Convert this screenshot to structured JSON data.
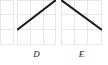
{
  "figure": {
    "background_color": "#ffffff",
    "grid_color": "#e6e6e6",
    "line_color": "#1a1a1a",
    "panel_count_visible": 3
  },
  "chart_data": [
    {
      "id": "panel-c",
      "type": "line",
      "title": "",
      "label": "",
      "truncated": true,
      "note": "partially visible panel clipped by left edge of image",
      "grid": {
        "on": true,
        "columns": 3,
        "rows": 3
      },
      "xlabel": "",
      "ylabel": "",
      "xlim": [
        0,
        3
      ],
      "ylim": [
        0,
        3
      ],
      "x": [],
      "values": [],
      "series": []
    },
    {
      "id": "panel-d",
      "type": "line",
      "title": "",
      "label": "D",
      "truncated": false,
      "note": "single straight increasing line from lower-left to upper-right corner",
      "grid": {
        "on": true,
        "columns": 3,
        "rows": 3
      },
      "xlabel": "",
      "ylabel": "",
      "xlim": [
        0,
        3
      ],
      "ylim": [
        0,
        3
      ],
      "x": [
        0,
        3
      ],
      "values": [
        1,
        3
      ],
      "series": [
        {
          "name": "D",
          "x": [
            0,
            3
          ],
          "values": [
            1,
            3
          ]
        }
      ]
    },
    {
      "id": "panel-e",
      "type": "line",
      "title": "",
      "label": "E",
      "truncated": false,
      "note": "single straight decreasing line from upper-left corner to lower-right",
      "grid": {
        "on": true,
        "columns": 3,
        "rows": 3
      },
      "xlabel": "",
      "ylabel": "",
      "xlim": [
        0,
        3
      ],
      "ylim": [
        0,
        3
      ],
      "x": [
        0,
        3
      ],
      "values": [
        3,
        1
      ],
      "series": [
        {
          "name": "E",
          "x": [
            0,
            3
          ],
          "values": [
            3,
            1
          ]
        }
      ]
    }
  ],
  "labels": {
    "panel_d": "D",
    "panel_e": "E"
  }
}
